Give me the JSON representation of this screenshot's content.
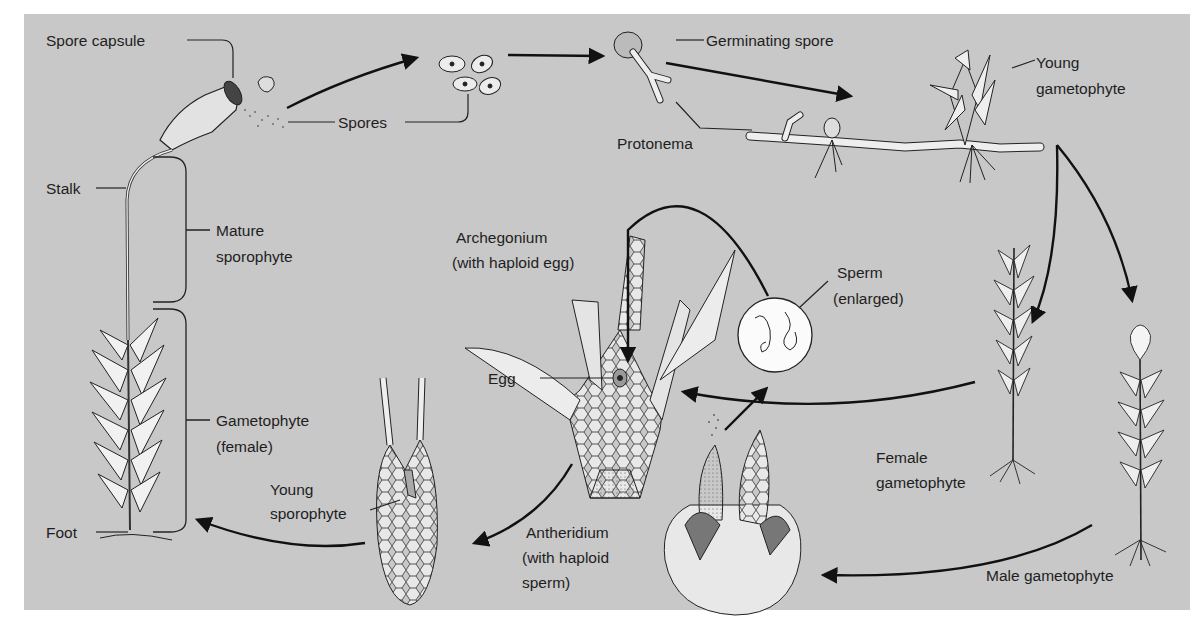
{
  "diagram": {
    "background_color": "#c8c8c8",
    "line_color": "#111111",
    "labels": {
      "spore_capsule": "Spore capsule",
      "spores": "Spores",
      "germinating_spore": "Germinating spore",
      "young_gametophyte_1": "Young",
      "young_gametophyte_2": "gametophyte",
      "protonema": "Protonema",
      "stalk": "Stalk",
      "mature_sporophyte_1": "Mature",
      "mature_sporophyte_2": "sporophyte",
      "gametophyte_female_1": "Gametophyte",
      "gametophyte_female_2": "(female)",
      "foot": "Foot",
      "young_sporophyte_1": "Young",
      "young_sporophyte_2": "sporophyte",
      "archegonium_1": "Archegonium",
      "archegonium_2": "(with haploid egg)",
      "egg": "Egg",
      "sperm_1": "Sperm",
      "sperm_2": "(enlarged)",
      "antheridium_1": "Antheridium",
      "antheridium_2": "(with haploid",
      "antheridium_3": "sperm)",
      "female_gametophyte_1": "Female",
      "female_gametophyte_2": "gametophyte",
      "male_gametophyte": "Male gametophyte"
    },
    "stages": [
      {
        "id": "spore-capsule",
        "name": "Spore capsule"
      },
      {
        "id": "spores",
        "name": "Spores"
      },
      {
        "id": "germinating-spore",
        "name": "Germinating spore"
      },
      {
        "id": "protonema",
        "name": "Protonema"
      },
      {
        "id": "young-gametophyte",
        "name": "Young gametophyte"
      },
      {
        "id": "female-gametophyte",
        "name": "Female gametophyte"
      },
      {
        "id": "male-gametophyte",
        "name": "Male gametophyte"
      },
      {
        "id": "antheridium",
        "name": "Antheridium (with haploid sperm)"
      },
      {
        "id": "sperm",
        "name": "Sperm (enlarged)"
      },
      {
        "id": "archegonium",
        "name": "Archegonium (with haploid egg)"
      },
      {
        "id": "young-sporophyte",
        "name": "Young sporophyte"
      },
      {
        "id": "mature-sporophyte",
        "name": "Mature sporophyte on Gametophyte (female)"
      }
    ],
    "flow_edges": [
      {
        "from": "spore-capsule",
        "to": "spores"
      },
      {
        "from": "spores",
        "to": "germinating-spore"
      },
      {
        "from": "germinating-spore",
        "to": "young-gametophyte"
      },
      {
        "from": "young-gametophyte",
        "to": "female-gametophyte"
      },
      {
        "from": "young-gametophyte",
        "to": "male-gametophyte"
      },
      {
        "from": "female-gametophyte",
        "to": "archegonium"
      },
      {
        "from": "male-gametophyte",
        "to": "antheridium"
      },
      {
        "from": "antheridium",
        "to": "sperm"
      },
      {
        "from": "sperm",
        "to": "archegonium"
      },
      {
        "from": "archegonium",
        "to": "young-sporophyte"
      },
      {
        "from": "young-sporophyte",
        "to": "mature-sporophyte"
      }
    ]
  }
}
